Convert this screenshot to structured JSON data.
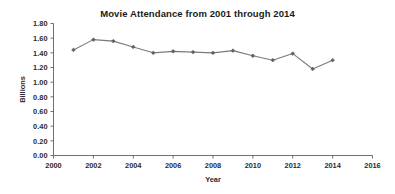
{
  "chart_data": {
    "type": "line",
    "title": "Movie Attendance from 2001 through 2014",
    "xlabel": "Year",
    "ylabel": "Billions",
    "x": [
      2001,
      2002,
      2003,
      2004,
      2005,
      2006,
      2007,
      2008,
      2009,
      2010,
      2011,
      2012,
      2013,
      2014
    ],
    "values": [
      1.44,
      1.58,
      1.56,
      1.48,
      1.4,
      1.42,
      1.41,
      1.4,
      1.43,
      1.36,
      1.3,
      1.39,
      1.18,
      1.3
    ],
    "series": [
      {
        "name": "Movie Attendance",
        "values": [
          1.44,
          1.58,
          1.56,
          1.48,
          1.4,
          1.42,
          1.41,
          1.4,
          1.43,
          1.36,
          1.3,
          1.39,
          1.18,
          1.3
        ]
      }
    ],
    "xlim": [
      2000,
      2016
    ],
    "ylim": [
      0.0,
      1.8
    ],
    "xticks": [
      2000,
      2002,
      2004,
      2006,
      2008,
      2010,
      2012,
      2014,
      2016
    ],
    "xtick_labels": [
      "2000",
      "2002",
      "2004",
      "2006",
      "2008",
      "2010",
      "2012",
      "2014",
      "2016"
    ],
    "yticks": [
      0.0,
      0.2,
      0.4,
      0.6,
      0.8,
      1.0,
      1.2,
      1.4,
      1.6,
      1.8
    ],
    "ytick_labels": [
      "0.00",
      "0.20",
      "0.40",
      "0.60",
      "0.80",
      "1.00",
      "1.20",
      "1.40",
      "1.60",
      "1.80"
    ],
    "grid": false,
    "legend": false,
    "legend_position": "none",
    "marker": "diamond",
    "line_color": "#7a7a7a",
    "marker_color": "#5f5f5f",
    "axis_color": "#6f6f6f",
    "text_color": "#2b2b2b",
    "background_color": "#ffffff"
  }
}
